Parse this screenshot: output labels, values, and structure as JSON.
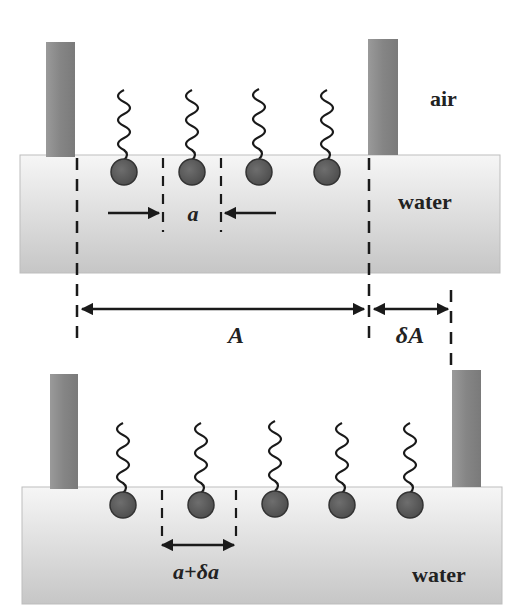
{
  "figure": {
    "top_panel": {
      "phase_labels": {
        "air": "air",
        "water": "water"
      },
      "molecule_count": 4,
      "spacing_label": "a"
    },
    "dimensions": {
      "area_label": "A",
      "delta_area_label": "δA"
    },
    "bottom_panel": {
      "phase_labels": {
        "water": "water"
      },
      "molecule_count": 5,
      "spacing_label": "a+δa"
    }
  },
  "colors": {
    "barrier": "#8a8a8a",
    "water_top": "#f4f4f4",
    "water_bottom": "#c9c9c9",
    "headgroup": "#5c5c5c",
    "line": "#1a1a1a"
  }
}
